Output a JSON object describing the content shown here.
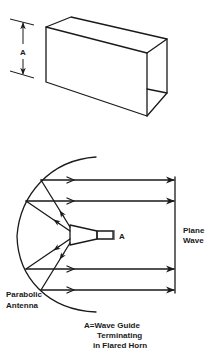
{
  "figure": {
    "waveguide_box": {
      "dimension_label": "A"
    },
    "antenna_diagram": {
      "horn_label": "A",
      "plane_wave_label_line1": "Plane",
      "plane_wave_label_line2": "Wave",
      "antenna_label_line1": "Parabolic",
      "antenna_label_line2": "Antenna",
      "caption_line1": "A=Wave Guide",
      "caption_line2": "Terminating",
      "caption_line3": "in Flared Horn"
    },
    "colors": {
      "ink": "#1a1a1a",
      "background": "#ffffff"
    }
  }
}
